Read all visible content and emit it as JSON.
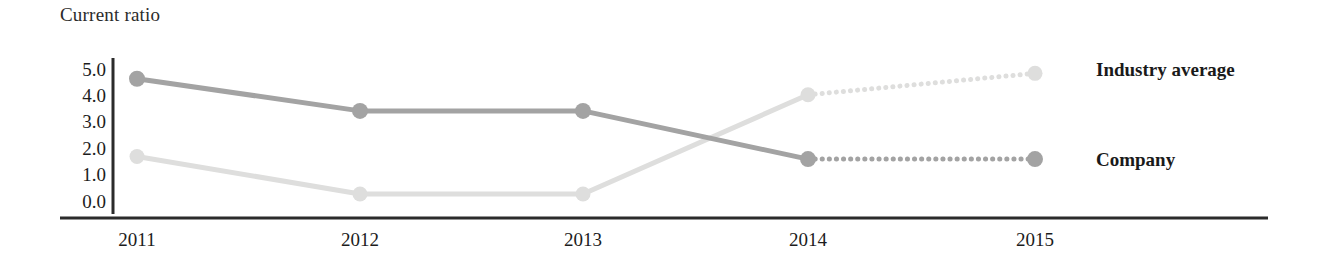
{
  "chart_data": {
    "type": "line",
    "title": "Current ratio",
    "xlabel": "",
    "ylabel": "",
    "categories": [
      "2011",
      "2012",
      "2013",
      "2014",
      "2015"
    ],
    "ylim": [
      0.0,
      5.0
    ],
    "yticks": [
      "0.0",
      "1.0",
      "2.0",
      "3.0",
      "4.0",
      "5.0"
    ],
    "grid": false,
    "legend_position": "right",
    "series": [
      {
        "name": "Industry average",
        "color": "#dededd",
        "values": [
          1.7,
          0.3,
          0.3,
          4.0,
          4.8
        ],
        "forecast_from_index": 3,
        "forecast_style": "dotted"
      },
      {
        "name": "Company",
        "color": "#a3a3a3",
        "values": [
          4.6,
          3.4,
          3.4,
          1.6,
          1.6
        ],
        "forecast_from_index": 3,
        "forecast_style": "dotted"
      }
    ]
  },
  "axis": {
    "line_color": "#2b2b2b"
  },
  "legend": {
    "industry_average": "Industry average",
    "company": "Company"
  },
  "yticks": {
    "t5": "5.0",
    "t4": "4.0",
    "t3": "3.0",
    "t2": "2.0",
    "t1": "1.0",
    "t0": "0.0"
  },
  "xticks": {
    "x0": "2011",
    "x1": "2012",
    "x2": "2013",
    "x3": "2014",
    "x4": "2015"
  }
}
